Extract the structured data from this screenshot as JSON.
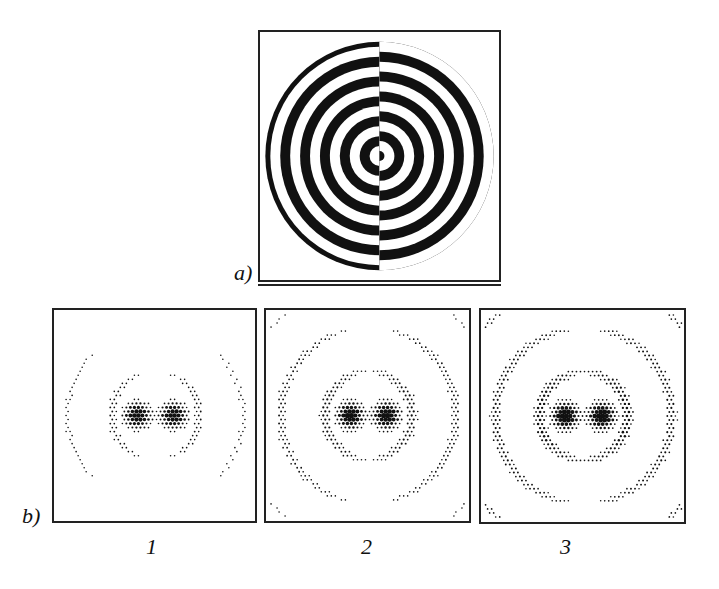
{
  "figure": {
    "panel_a": {
      "label": "a)",
      "description": "Binary zone plate with the right half phase-shifted by pi (rings offset at vertical mid-line)",
      "ring_count": 11,
      "colors": {
        "dark": "#111111",
        "light": "#ffffff"
      }
    },
    "panel_b": {
      "label": "b)",
      "subpanels": [
        {
          "number": "1",
          "intensity": 0.55
        },
        {
          "number": "2",
          "intensity": 0.8
        },
        {
          "number": "3",
          "intensity": 1.0
        }
      ],
      "description": "Intensity distributions: two central spots with surrounding ring fragments"
    }
  }
}
